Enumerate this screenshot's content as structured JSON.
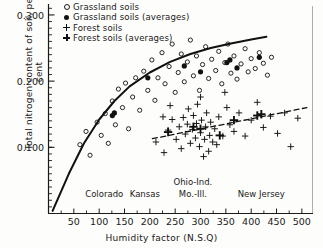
{
  "chart_data": {
    "type": "scatter",
    "title": "",
    "xlabel": "Humidity factor (N.S.Q)",
    "ylabel": "Total nitrogen content of soil, per cent",
    "xlim": [
      0,
      520
    ],
    "ylim": [
      0,
      0.315
    ],
    "grid": false,
    "xticks": [
      50,
      100,
      150,
      200,
      250,
      300,
      350,
      400,
      450,
      500
    ],
    "xtick_labels": [
      "50",
      "100",
      "150",
      "200",
      "250",
      "300",
      "350",
      "400",
      "450",
      "500"
    ],
    "yticks": [
      0.1,
      0.2,
      0.3
    ],
    "ytick_labels": [
      "0.100",
      "0.200",
      "0.300"
    ],
    "y_minor_step": 0.01,
    "legend_position": "top-left",
    "legend": [
      {
        "label": "Grassland soils",
        "marker": "open-circle"
      },
      {
        "label": "Grassland soils (averages)",
        "marker": "filled-circle"
      },
      {
        "label": "Forest soils",
        "marker": "thin-plus"
      },
      {
        "label": "Forest soils (averages)",
        "marker": "bold-plus"
      }
    ],
    "region_annotations": [
      {
        "text": "Colorado",
        "x": 110,
        "y": 0.028
      },
      {
        "text": "Kansas",
        "x": 190,
        "y": 0.028
      },
      {
        "text": "Ohio-Ind.",
        "x": 285,
        "y": 0.046
      },
      {
        "text": "Mo.-Ill.",
        "x": 285,
        "y": 0.028
      },
      {
        "text": "New Jersey",
        "x": 420,
        "y": 0.028
      }
    ],
    "series": [
      {
        "name": "Grassland soils",
        "marker": "open-circle",
        "points": [
          [
            62,
            0.104
          ],
          [
            74,
            0.124
          ],
          [
            82,
            0.088
          ],
          [
            96,
            0.138
          ],
          [
            104,
            0.118
          ],
          [
            112,
            0.151
          ],
          [
            118,
            0.106
          ],
          [
            126,
            0.17
          ],
          [
            132,
            0.134
          ],
          [
            138,
            0.188
          ],
          [
            146,
            0.16
          ],
          [
            152,
            0.197
          ],
          [
            158,
            0.128
          ],
          [
            166,
            0.176
          ],
          [
            172,
            0.205
          ],
          [
            180,
            0.156
          ],
          [
            188,
            0.215
          ],
          [
            196,
            0.186
          ],
          [
            204,
            0.232
          ],
          [
            210,
            0.171
          ],
          [
            216,
            0.205
          ],
          [
            224,
            0.243
          ],
          [
            230,
            0.196
          ],
          [
            238,
            0.222
          ],
          [
            244,
            0.256
          ],
          [
            250,
            0.183
          ],
          [
            256,
            0.213
          ],
          [
            262,
            0.241
          ],
          [
            268,
            0.199
          ],
          [
            274,
            0.229
          ],
          [
            280,
            0.262
          ],
          [
            286,
            0.208
          ],
          [
            292,
            0.238
          ],
          [
            298,
            0.186
          ],
          [
            304,
            0.225
          ],
          [
            310,
            0.252
          ],
          [
            316,
            0.204
          ],
          [
            322,
            0.233
          ],
          [
            330,
            0.216
          ],
          [
            336,
            0.245
          ],
          [
            342,
            0.196
          ],
          [
            348,
            0.228
          ],
          [
            354,
            0.256
          ],
          [
            360,
            0.212
          ],
          [
            366,
            0.238
          ],
          [
            372,
            0.203
          ],
          [
            380,
            0.226
          ],
          [
            388,
            0.249
          ],
          [
            394,
            0.214
          ],
          [
            400,
            0.234
          ],
          [
            408,
            0.219
          ],
          [
            416,
            0.243
          ],
          [
            424,
            0.227
          ],
          [
            432,
            0.209
          ],
          [
            440,
            0.236
          ]
        ]
      },
      {
        "name": "Grassland soils (averages)",
        "marker": "filled-circle",
        "points": [
          [
            126,
            0.148
          ],
          [
            130,
            0.152
          ],
          [
            196,
            0.205
          ],
          [
            268,
            0.223
          ],
          [
            300,
            0.214
          ],
          [
            352,
            0.228
          ],
          [
            358,
            0.232
          ],
          [
            372,
            0.22
          ],
          [
            416,
            0.236
          ]
        ]
      },
      {
        "name": "Forest soils",
        "marker": "thin-plus",
        "points": [
          [
            212,
            0.108
          ],
          [
            228,
            0.092
          ],
          [
            236,
            0.126
          ],
          [
            244,
            0.142
          ],
          [
            252,
            0.112
          ],
          [
            258,
            0.131
          ],
          [
            262,
            0.098
          ],
          [
            266,
            0.145
          ],
          [
            270,
            0.12
          ],
          [
            274,
            0.135
          ],
          [
            276,
            0.158
          ],
          [
            280,
            0.106
          ],
          [
            284,
            0.127
          ],
          [
            286,
            0.148
          ],
          [
            290,
            0.114
          ],
          [
            292,
            0.136
          ],
          [
            294,
            0.165
          ],
          [
            298,
            0.101
          ],
          [
            300,
            0.122
          ],
          [
            302,
            0.141
          ],
          [
            306,
            0.086
          ],
          [
            308,
            0.112
          ],
          [
            310,
            0.131
          ],
          [
            312,
            0.152
          ],
          [
            316,
            0.094
          ],
          [
            318,
            0.118
          ],
          [
            320,
            0.138
          ],
          [
            324,
            0.108
          ],
          [
            328,
            0.128
          ],
          [
            332,
            0.104
          ],
          [
            336,
            0.146
          ],
          [
            344,
            0.117
          ],
          [
            352,
            0.16
          ],
          [
            358,
            0.134
          ],
          [
            366,
            0.124
          ],
          [
            376,
            0.152
          ],
          [
            388,
            0.117
          ],
          [
            400,
            0.141
          ],
          [
            412,
            0.168
          ],
          [
            424,
            0.13
          ],
          [
            438,
            0.147
          ],
          [
            452,
            0.121
          ],
          [
            466,
            0.152
          ],
          [
            478,
            0.101
          ],
          [
            492,
            0.144
          ],
          [
            226,
            0.146
          ],
          [
            240,
            0.163
          ],
          [
            300,
            0.176
          ],
          [
            348,
            0.183
          ]
        ]
      },
      {
        "name": "Forest soils (averages)",
        "marker": "bold-plus",
        "points": [
          [
            236,
            0.123
          ],
          [
            286,
            0.131
          ],
          [
            300,
            0.128
          ],
          [
            338,
            0.118
          ],
          [
            366,
            0.141
          ],
          [
            412,
            0.148
          ],
          [
            420,
            0.15
          ]
        ]
      }
    ],
    "trend_lines": [
      {
        "name": "grassland-curve",
        "style": "solid",
        "points": [
          [
            8,
            0.004
          ],
          [
            40,
            0.06
          ],
          [
            70,
            0.106
          ],
          [
            100,
            0.142
          ],
          [
            130,
            0.17
          ],
          [
            160,
            0.192
          ],
          [
            200,
            0.213
          ],
          [
            240,
            0.229
          ],
          [
            280,
            0.241
          ],
          [
            320,
            0.25
          ],
          [
            360,
            0.257
          ],
          [
            400,
            0.263
          ],
          [
            430,
            0.267
          ]
        ]
      },
      {
        "name": "forest-dashed-line",
        "style": "dashed",
        "points": [
          [
            205,
            0.113
          ],
          [
            510,
            0.16
          ]
        ]
      }
    ]
  }
}
